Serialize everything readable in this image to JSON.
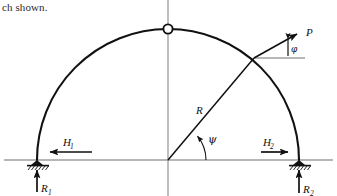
{
  "page": {
    "caption_fragment": "ch shown.",
    "width": 337,
    "height": 196,
    "background": "#ffffff",
    "ink_color": "#111111",
    "centerline_color": "#8a8a8a"
  },
  "figure": {
    "name": "three-hinged-semicircular-arch-free-body-diagram",
    "structure_type": "three-hinged circular arch",
    "labels": {
      "radius": "R",
      "load": "P",
      "load_angle": "φ",
      "position_angle": "ψ",
      "left_horizontal_reaction": "H",
      "left_horizontal_reaction_sub": "1",
      "right_horizontal_reaction": "H",
      "right_horizontal_reaction_sub": "2",
      "left_vertical_reaction": "R",
      "left_vertical_reaction_sub": "1",
      "right_vertical_reaction": "R",
      "right_vertical_reaction_sub": "2"
    },
    "geometry": {
      "center_x": 168,
      "center_y": 160,
      "radius_px": 131,
      "crown_hinge_x": 168,
      "crown_hinge_y": 29,
      "crown_hinge_radius_px": 4.6,
      "left_support_x": 37,
      "left_support_y": 160,
      "right_support_x": 299,
      "right_support_y": 160,
      "load_point_x": 254,
      "load_point_y": 58,
      "psi_degrees": 39,
      "baseline_y": 160,
      "baseline_x_start": 4,
      "baseline_x_end": 333,
      "centerline_x": 168,
      "centerline_y_top": 0,
      "centerline_y_bottom": 196
    },
    "forces": [
      {
        "name": "P",
        "point": "load-point",
        "direction": "up-right",
        "angle_label": "φ"
      },
      {
        "name": "H1",
        "point": "left-support",
        "direction": "left"
      },
      {
        "name": "R1",
        "point": "left-support",
        "direction": "up"
      },
      {
        "name": "H2",
        "point": "right-support",
        "direction": "right"
      },
      {
        "name": "R2",
        "point": "right-support",
        "direction": "up"
      }
    ],
    "supports": [
      {
        "name": "left-pin-support",
        "x": 37,
        "y": 160,
        "hatched": true
      },
      {
        "name": "right-pin-support",
        "x": 299,
        "y": 160,
        "hatched": true
      }
    ]
  }
}
